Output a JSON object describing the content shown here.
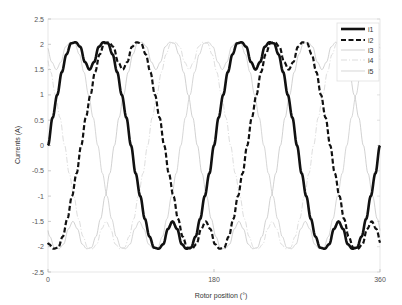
{
  "chart_data": {
    "type": "line",
    "title": "",
    "xlabel": "Rotor position (°)",
    "ylabel": "Currents (A)",
    "xlim": [
      0,
      360
    ],
    "ylim": [
      -2.5,
      2.5
    ],
    "xticks": [
      0,
      180,
      360
    ],
    "xtick_labels": [
      "0",
      "180",
      "360"
    ],
    "yticks": [
      2.5,
      2,
      1.5,
      1,
      0.5,
      0,
      -0.5,
      -1,
      -1.5,
      -2,
      -2.5
    ],
    "ytick_labels": [
      "2.5",
      "2",
      "1.5",
      "1",
      "0.5",
      "0",
      "-0.5",
      "-1",
      "-1.5",
      "-2",
      "-2.5"
    ],
    "grid": false,
    "legend_position": "upper right",
    "x": [
      0,
      10,
      20,
      30,
      40,
      50,
      60,
      70,
      80,
      90,
      100,
      110,
      120,
      130,
      140,
      150,
      160,
      170,
      180,
      190,
      200,
      210,
      220,
      230,
      240,
      250,
      260,
      270,
      280,
      290,
      300,
      310,
      320,
      330,
      340,
      350,
      360
    ],
    "series": [
      {
        "name": "i1",
        "style": "solid-thick",
        "color": "#111111",
        "values": [
          0,
          1.0,
          1.8,
          2.04,
          1.65,
          1.65,
          2.04,
          1.8,
          1.0,
          0,
          -1.0,
          -1.8,
          -2.04,
          -1.65,
          -1.65,
          -2.04,
          -1.8,
          -1.0,
          0,
          1.0,
          1.8,
          2.04,
          1.65,
          1.65,
          2.04,
          1.8,
          1.0,
          0,
          -1.0,
          -1.8,
          -2.04,
          -1.65,
          -1.65,
          -2.04,
          -1.8,
          -1.0,
          0
        ]
      },
      {
        "name": "i2",
        "style": "dashed-thick",
        "color": "#111111",
        "values": [
          -1.9,
          -2.02,
          -1.52,
          -0.64,
          0.46,
          1.36,
          1.98,
          1.97,
          1.53,
          1.9,
          2.02,
          1.52,
          0.64,
          -0.46,
          -1.36,
          -1.98,
          -1.97,
          -1.53,
          -1.9,
          -2.02,
          -1.52,
          -0.64,
          0.46,
          1.36,
          1.98,
          1.97,
          1.53,
          1.9,
          2.02,
          1.52,
          0.64,
          -0.46,
          -1.36,
          -1.98,
          -1.97,
          -1.53,
          -1.9
        ]
      },
      {
        "name": "i3",
        "style": "solid-thin",
        "color": "#bdbdbd",
        "values": [
          -1.66,
          -2.03,
          -1.77,
          -1.56,
          -2.0,
          -1.9,
          -1.18,
          -0.22,
          0.82,
          1.66,
          2.03,
          1.77,
          1.56,
          2.0,
          1.9,
          1.18,
          0.22,
          -0.82,
          -1.66,
          -2.03,
          -1.77,
          -1.56,
          -2.0,
          -1.9,
          -1.18,
          -0.22,
          0.82,
          1.66,
          2.03,
          1.77,
          1.56,
          2.0,
          1.9,
          1.18,
          0.22,
          -0.82,
          -1.66
        ]
      },
      {
        "name": "i4",
        "style": "dashdot-thin",
        "color": "#cfcfcf",
        "values": [
          1.66,
          0.82,
          -0.22,
          -1.18,
          -1.9,
          -2.0,
          -1.56,
          -1.77,
          -2.03,
          -1.66,
          -0.82,
          0.22,
          1.18,
          1.9,
          2.0,
          1.56,
          1.77,
          2.03,
          1.66,
          0.82,
          -0.22,
          -1.18,
          -1.9,
          -2.0,
          -1.56,
          -1.77,
          -2.03,
          -1.66,
          -0.82,
          0.22,
          1.18,
          1.9,
          2.0,
          1.56,
          1.77,
          2.03,
          1.66
        ]
      },
      {
        "name": "i5",
        "style": "solid-thin",
        "color": "#c4c4c4",
        "values": [
          1.9,
          1.53,
          1.97,
          1.98,
          1.36,
          0.46,
          -0.64,
          -1.52,
          -2.02,
          -1.9,
          -1.53,
          -1.97,
          -1.98,
          -1.36,
          -0.46,
          0.64,
          1.52,
          2.02,
          1.9,
          1.53,
          1.97,
          1.98,
          1.36,
          0.46,
          -0.64,
          -1.52,
          -2.02,
          -1.9,
          -1.53,
          -1.97,
          -1.98,
          -1.36,
          -0.46,
          0.64,
          1.52,
          2.02,
          1.9
        ]
      }
    ],
    "waveform_model": {
      "electrical_step_deg": 10,
      "half_cycle_shape": [
        0,
        0.55,
        1.0,
        1.45,
        1.8,
        2.02,
        2.04,
        1.95,
        1.65,
        1.5,
        1.65,
        1.95,
        2.04,
        2.02,
        1.8,
        1.45,
        1.0,
        0.55,
        0
      ],
      "pole_pairs": 2,
      "phase_shift_elec_deg": [
        0,
        72,
        144,
        216,
        288
      ]
    }
  },
  "legend": {
    "items": [
      {
        "label": "i1"
      },
      {
        "label": "i2"
      },
      {
        "label": "i3"
      },
      {
        "label": "i4"
      },
      {
        "label": "i5"
      }
    ]
  }
}
